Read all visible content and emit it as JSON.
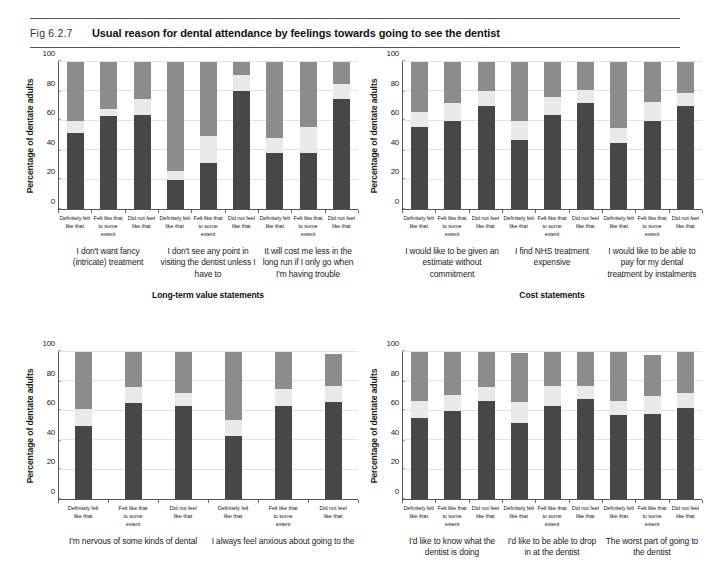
{
  "header": {
    "fig_number": "Fig 6.2.7",
    "title": "Usual reason for dental attendance by feelings towards going to see the dentist"
  },
  "axis": {
    "ylabel": "Percentage of dentate adults",
    "yticks": [
      "0",
      "20",
      "40",
      "60",
      "80",
      "100"
    ],
    "categories": [
      "Definitely felt like that",
      "Felt like that to some extent",
      "Did not feel like that"
    ]
  },
  "legend_colors": {
    "bottom_segment": "#474747",
    "middle_segment": "#e9e9e9",
    "top_segment": "#8c8c8c"
  },
  "chart_data": {
    "type": "bar",
    "title": "Usual reason for dental attendance by feelings towards going to see the dentist",
    "xlabel": "",
    "ylabel": "Percentage of dentate adults",
    "ylim": [
      0,
      100
    ],
    "grid": true,
    "stacked": true,
    "categories": [
      "Definitely felt like that",
      "Felt like that to some extent",
      "Did not feel like that"
    ],
    "series": [
      {
        "name": "bottom-segment",
        "color": "#474747"
      },
      {
        "name": "middle-segment",
        "color": "#e9e9e9"
      },
      {
        "name": "top-segment",
        "color": "#8c8c8c"
      }
    ],
    "panels": [
      {
        "panel_id": "top-left",
        "group_title": "Long-term value statements",
        "statements": [
          {
            "label": "I don't want fancy (intricate) treatment",
            "bars": [
              {
                "category": "Definitely felt like that",
                "bottom": 52,
                "middle": 8,
                "top": 40
              },
              {
                "category": "Felt like that to some extent",
                "bottom": 63,
                "middle": 5,
                "top": 32
              },
              {
                "category": "Did not feel like that",
                "bottom": 64,
                "middle": 11,
                "top": 25
              }
            ]
          },
          {
            "label": "I don't see any point in visiting the dentist unless I have to",
            "bars": [
              {
                "category": "Definitely felt like that",
                "bottom": 20,
                "middle": 6,
                "top": 74
              },
              {
                "category": "Felt like that to some extent",
                "bottom": 31,
                "middle": 19,
                "top": 50
              },
              {
                "category": "Did not feel like that",
                "bottom": 80,
                "middle": 11,
                "top": 9
              }
            ]
          },
          {
            "label": "It will cost me less in the long run if I only go when I'm having trouble",
            "bars": [
              {
                "category": "Definitely felt like that",
                "bottom": 38,
                "middle": 10,
                "top": 52
              },
              {
                "category": "Felt like that to some extent",
                "bottom": 38,
                "middle": 18,
                "top": 44
              },
              {
                "category": "Did not feel like that",
                "bottom": 75,
                "middle": 10,
                "top": 15
              }
            ]
          }
        ]
      },
      {
        "panel_id": "top-right",
        "group_title": "Cost statements",
        "statements": [
          {
            "label": "I would like to be given an estimate without commitment",
            "bars": [
              {
                "category": "Definitely felt like that",
                "bottom": 56,
                "middle": 10,
                "top": 34
              },
              {
                "category": "Felt like that to some extent",
                "bottom": 60,
                "middle": 12,
                "top": 28
              },
              {
                "category": "Did not feel like that",
                "bottom": 70,
                "middle": 10,
                "top": 20
              }
            ]
          },
          {
            "label": "I find NHS treatment expensive",
            "bars": [
              {
                "category": "Definitely felt like that",
                "bottom": 47,
                "middle": 13,
                "top": 40
              },
              {
                "category": "Felt like that to some extent",
                "bottom": 64,
                "middle": 12,
                "top": 24
              },
              {
                "category": "Did not feel like that",
                "bottom": 72,
                "middle": 9,
                "top": 19
              }
            ]
          },
          {
            "label": "I would like to be able to pay for my dental treatment by instalments",
            "bars": [
              {
                "category": "Definitely felt like that",
                "bottom": 45,
                "middle": 10,
                "top": 45
              },
              {
                "category": "Felt like that to some extent",
                "bottom": 60,
                "middle": 13,
                "top": 27
              },
              {
                "category": "Did not feel like that",
                "bottom": 70,
                "middle": 9,
                "top": 21
              }
            ]
          }
        ]
      },
      {
        "panel_id": "bottom-left",
        "group_title": "",
        "statements": [
          {
            "label": "I'm nervous of some kinds of dental",
            "bars": [
              {
                "category": "Definitely felt like that",
                "bottom": 50,
                "middle": 11,
                "top": 39
              },
              {
                "category": "Felt like that to some extent",
                "bottom": 65,
                "middle": 11,
                "top": 24
              },
              {
                "category": "Did not feel like that",
                "bottom": 63,
                "middle": 9,
                "top": 28
              }
            ]
          },
          {
            "label": "I always feel anxious about going to the",
            "bars": [
              {
                "category": "Definitely felt like that",
                "bottom": 43,
                "middle": 11,
                "top": 46
              },
              {
                "category": "Felt like that to some extent",
                "bottom": 63,
                "middle": 12,
                "top": 25
              },
              {
                "category": "Did not feel like that",
                "bottom": 66,
                "middle": 11,
                "top": 22
              }
            ]
          }
        ]
      },
      {
        "panel_id": "bottom-right",
        "group_title": "",
        "statements": [
          {
            "label": "I'd like to know what the dentist is doing",
            "bars": [
              {
                "category": "Definitely felt like that",
                "bottom": 55,
                "middle": 12,
                "top": 33
              },
              {
                "category": "Felt like that to some extent",
                "bottom": 60,
                "middle": 11,
                "top": 29
              },
              {
                "category": "Did not feel like that",
                "bottom": 67,
                "middle": 9,
                "top": 24
              }
            ]
          },
          {
            "label": "I'd like to be able to drop in at the dentist",
            "bars": [
              {
                "category": "Definitely felt like that",
                "bottom": 52,
                "middle": 14,
                "top": 33
              },
              {
                "category": "Felt like that to some extent",
                "bottom": 63,
                "middle": 14,
                "top": 23
              },
              {
                "category": "Did not feel like that",
                "bottom": 68,
                "middle": 9,
                "top": 23
              }
            ]
          },
          {
            "label": "The worst part of going to the dentist",
            "bars": [
              {
                "category": "Definitely felt like that",
                "bottom": 57,
                "middle": 10,
                "top": 33
              },
              {
                "category": "Felt like that to some extent",
                "bottom": 58,
                "middle": 12,
                "top": 28
              },
              {
                "category": "Did not feel like that",
                "bottom": 62,
                "middle": 10,
                "top": 28
              }
            ]
          }
        ]
      }
    ]
  }
}
